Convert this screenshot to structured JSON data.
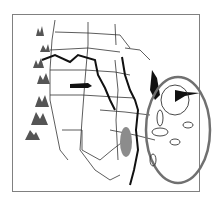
{
  "map": {
    "type": "schematic map of central/eastern United States",
    "colors": {
      "frame": "#808080",
      "borders": "#333333",
      "river": "#111111",
      "mountains": "#555555",
      "highlight_oval": "#707070",
      "gray_region": "#8c8c8c"
    },
    "features": {
      "mountains": "mountain-range symbols along western edge",
      "rivers": "major river system (thick black lines)",
      "lake": "gray shaded lake/region",
      "highlight": "large gray oval encircling eastern lake region",
      "small_ovals": "several small outlined ovals inside highlight"
    }
  }
}
